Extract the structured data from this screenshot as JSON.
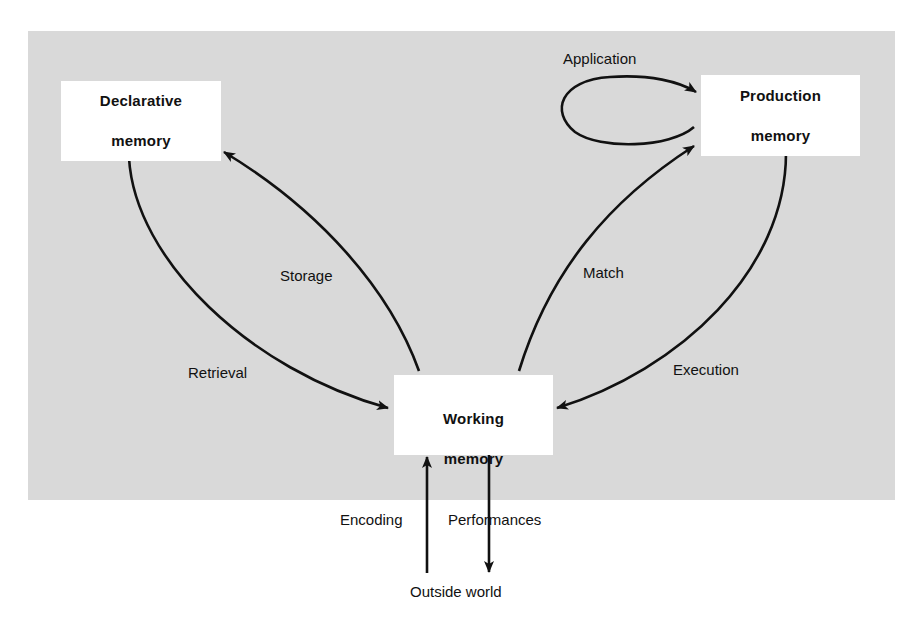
{
  "diagram": {
    "nodes": {
      "declarative": {
        "line1": "Declarative",
        "line2": "memory"
      },
      "production": {
        "line1": "Production",
        "line2": "memory"
      },
      "working": {
        "line1": "Working",
        "line2": "memory"
      },
      "outside": {
        "label": "Outside world"
      }
    },
    "edges": {
      "application": "Application",
      "storage": "Storage",
      "retrieval": "Retrieval",
      "match": "Match",
      "execution": "Execution",
      "encoding": "Encoding",
      "performances": "Performances"
    },
    "colors": {
      "panel_background": "#d9d9d9",
      "node_background": "#ffffff",
      "stroke": "#111111"
    }
  }
}
